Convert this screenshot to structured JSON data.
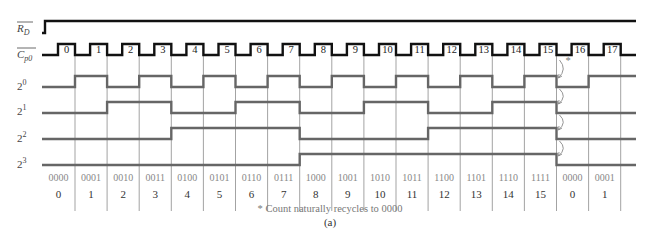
{
  "figure": {
    "caption": "(a)",
    "footnote": "* Count naturally recycles to 0000",
    "recycle_marker": "*"
  },
  "signals": {
    "rd": {
      "label": "R",
      "sub": "D",
      "overbar": true
    },
    "cp0": {
      "label": "C",
      "sub": "p0",
      "overbar": true
    },
    "q0": {
      "label": "2",
      "sup": "0"
    },
    "q1": {
      "label": "2",
      "sup": "1"
    },
    "q2": {
      "label": "2",
      "sup": "2"
    },
    "q3": {
      "label": "2",
      "sup": "3"
    }
  },
  "pulses": [
    "0",
    "1",
    "2",
    "3",
    "4",
    "5",
    "6",
    "7",
    "8",
    "9",
    "10",
    "11",
    "12",
    "13",
    "14",
    "15",
    "16",
    "17"
  ],
  "states": [
    {
      "bin": "0000",
      "dec": "0"
    },
    {
      "bin": "0001",
      "dec": "1"
    },
    {
      "bin": "0010",
      "dec": "2"
    },
    {
      "bin": "0011",
      "dec": "3"
    },
    {
      "bin": "0100",
      "dec": "4"
    },
    {
      "bin": "0101",
      "dec": "5"
    },
    {
      "bin": "0110",
      "dec": "6"
    },
    {
      "bin": "0111",
      "dec": "7"
    },
    {
      "bin": "1000",
      "dec": "8"
    },
    {
      "bin": "1001",
      "dec": "9"
    },
    {
      "bin": "1010",
      "dec": "10"
    },
    {
      "bin": "1011",
      "dec": "11"
    },
    {
      "bin": "1100",
      "dec": "12"
    },
    {
      "bin": "1101",
      "dec": "13"
    },
    {
      "bin": "1110",
      "dec": "14"
    },
    {
      "bin": "1111",
      "dec": "15"
    },
    {
      "bin": "0000",
      "dec": "0"
    },
    {
      "bin": "0001",
      "dec": "1"
    }
  ],
  "colors": {
    "clock": "#111111",
    "output": "#666666",
    "grid": "#999999",
    "arrow": "#888888"
  }
}
